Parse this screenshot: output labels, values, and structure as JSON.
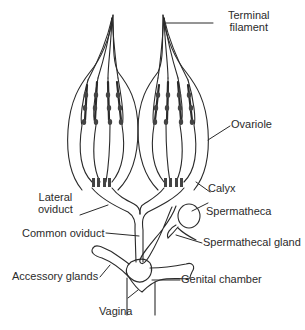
{
  "diagram": {
    "colors": {
      "stroke": "#2a2a2a",
      "background": "#ffffff"
    },
    "labels": {
      "terminal_filament_1": "Terminal",
      "terminal_filament_2": "filament",
      "ovariole": "Ovariole",
      "calyx": "Calyx",
      "lateral_oviduct_1": "Lateral",
      "lateral_oviduct_2": "oviduct",
      "spermatheca": "Spermatheca",
      "common_oviduct": "Common oviduct",
      "spermathecal_gland": "Spermathecal gland",
      "accessory_glands": "Accessory glands",
      "genital_chamber": "Genital chamber",
      "vagina": "Vagina"
    }
  }
}
